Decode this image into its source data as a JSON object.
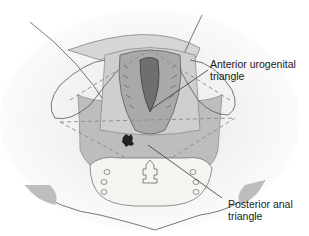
{
  "figure": {
    "labels": {
      "anterior": {
        "line1": "Anterior urogenital",
        "line2": "triangle"
      },
      "posterior": {
        "line1": "Posterior anal",
        "line2": "triangle"
      }
    },
    "colors": {
      "background": "#ffffff",
      "skin": "#ebebeb",
      "bone": "#f4f4f0",
      "triangle_fill": "#bdbdbd",
      "outline": "#555555",
      "leader_line": "#333333",
      "dashed": "#999999"
    }
  }
}
